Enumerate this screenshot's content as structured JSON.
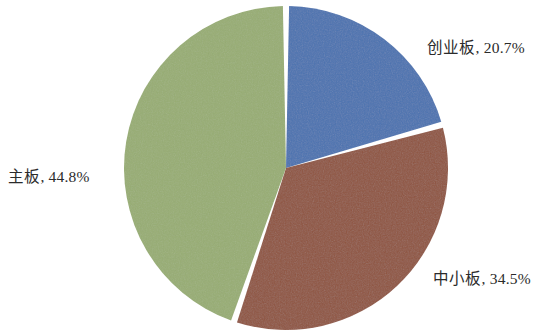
{
  "chart_data": {
    "type": "pie",
    "title": "",
    "categories": [
      "创业板",
      "中小板",
      "主板"
    ],
    "values": [
      20.7,
      34.5,
      44.8
    ],
    "value_unit": "%",
    "labels": [
      {
        "name": "创业板",
        "value": 20.7,
        "text": "创业板, 20.7%",
        "color": "#4a72b0",
        "position": "right-top"
      },
      {
        "name": "中小板",
        "value": 34.5,
        "text": "中小板, 34.5%",
        "color": "#8f5440",
        "position": "right-bottom"
      },
      {
        "name": "主板",
        "value": 44.8,
        "text": "主板, 44.8%",
        "color": "#97ad73",
        "position": "left-middle"
      }
    ],
    "legend": "none",
    "start_angle_deg": 0,
    "direction": "clockwise",
    "exploded": true,
    "gap_deg": 2.2,
    "grid": false,
    "background": "#ffffff",
    "label_color": "#2b2b2b"
  },
  "geometry": {
    "center_x": 286,
    "center_y": 168,
    "radius": 162
  }
}
